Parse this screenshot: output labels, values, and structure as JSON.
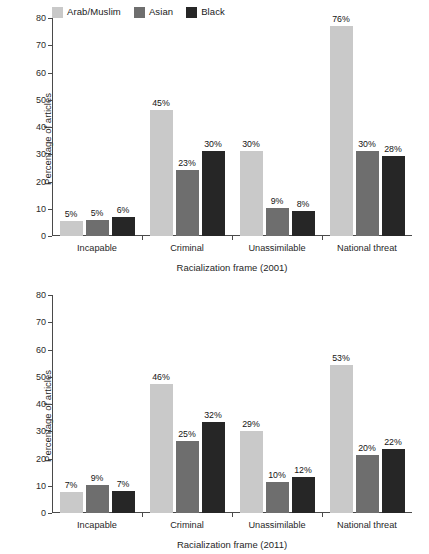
{
  "figure": {
    "legend": [
      {
        "label": "Arab/Muslim",
        "color": "#c9c9c9"
      },
      {
        "label": "Asian",
        "color": "#6e6e6e"
      },
      {
        "label": "Black",
        "color": "#262626"
      }
    ],
    "axis": {
      "ylabel": "Percentage of articles",
      "yticks": [
        "0",
        "10",
        "20",
        "30",
        "40",
        "50",
        "60",
        "70",
        "80"
      ]
    }
  },
  "chart_data": [
    {
      "type": "bar",
      "title": "",
      "xlabel": "Racialization frame (2001)",
      "ylabel": "Percentage of articles",
      "ylim": [
        0,
        80
      ],
      "yticks": [
        0,
        10,
        20,
        30,
        40,
        50,
        60,
        70,
        80
      ],
      "grid": false,
      "legend_position": "top-left",
      "categories": [
        "Incapable",
        "Criminal",
        "Unassimilable",
        "National threat"
      ],
      "series": [
        {
          "name": "Arab/Muslim",
          "color": "#c9c9c9",
          "values": [
            5,
            45,
            30,
            76
          ],
          "labels": [
            "5%",
            "45%",
            "30%",
            "76%"
          ],
          "drawn": [
            5.5,
            46.2,
            31.2,
            77.2
          ]
        },
        {
          "name": "Asian",
          "color": "#6e6e6e",
          "values": [
            5,
            23,
            9,
            30
          ],
          "labels": [
            "5%",
            "23%",
            "9%",
            "30%"
          ],
          "drawn": [
            5.7,
            24.3,
            10.2,
            31.3
          ]
        },
        {
          "name": "Black",
          "color": "#262626",
          "values": [
            6,
            30,
            8,
            28
          ],
          "labels": [
            "6%",
            "30%",
            "8%",
            "28%"
          ],
          "drawn": [
            6.9,
            31.3,
            9.3,
            29.2
          ]
        }
      ]
    },
    {
      "type": "bar",
      "title": "",
      "xlabel": "Racialization frame (2011)",
      "ylabel": "Percentage of articles",
      "ylim": [
        0,
        80
      ],
      "yticks": [
        0,
        10,
        20,
        30,
        40,
        50,
        60,
        70,
        80
      ],
      "grid": false,
      "legend_position": "none",
      "categories": [
        "Incapable",
        "Criminal",
        "Unassimilable",
        "National threat"
      ],
      "series": [
        {
          "name": "Arab/Muslim",
          "color": "#c9c9c9",
          "values": [
            7,
            46,
            29,
            53
          ],
          "labels": [
            "7%",
            "46%",
            "29%",
            "53%"
          ],
          "drawn": [
            7.8,
            47.3,
            30.2,
            54.3
          ]
        },
        {
          "name": "Asian",
          "color": "#6e6e6e",
          "values": [
            9,
            25,
            10,
            20
          ],
          "labels": [
            "9%",
            "25%",
            "10%",
            "20%"
          ],
          "drawn": [
            10.2,
            26.4,
            11.2,
            21.4
          ]
        },
        {
          "name": "Black",
          "color": "#262626",
          "values": [
            7,
            32,
            12,
            22
          ],
          "labels": [
            "7%",
            "32%",
            "12%",
            "22%"
          ],
          "drawn": [
            8.0,
            33.3,
            13.3,
            23.4
          ]
        }
      ]
    }
  ]
}
